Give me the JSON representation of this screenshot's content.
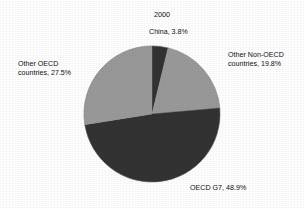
{
  "chart_data": {
    "type": "pie",
    "title": "2000",
    "xlabel": "",
    "ylabel": "",
    "legend_position": "none",
    "grid": false,
    "categories": [
      "China",
      "Other Non-OECD countries",
      "OECD G7",
      "Other OECD countries"
    ],
    "values": [
      3.8,
      19.8,
      48.9,
      27.5
    ],
    "units": "percent",
    "start_angle_deg": 0,
    "direction": "clockwise",
    "slices": [
      {
        "name": "China",
        "value": 3.8,
        "label": "China, 3.8%",
        "color": "#333333",
        "start_deg": 0,
        "end_deg": 13.68
      },
      {
        "name": "Other Non-OECD countries",
        "value": 19.8,
        "label": "Other Non-OECD\ncountries, 19.8%",
        "color": "#9a9a9a",
        "start_deg": 13.68,
        "end_deg": 84.96
      },
      {
        "name": "OECD G7",
        "value": 48.9,
        "label": "OECD G7, 48.9%",
        "color": "#333333",
        "start_deg": 84.96,
        "end_deg": 261.0
      },
      {
        "name": "Other OECD countries",
        "value": 27.5,
        "label": "Other OECD\ncountries, 27.5%",
        "color": "#9a9a9a",
        "start_deg": 261.0,
        "end_deg": 360.0
      }
    ]
  },
  "chart": {
    "title": "2000",
    "background": "#ffffff",
    "outline_color": "#6e6e6e",
    "colors": {
      "dark_slice": "#333333",
      "light_slice": "#9a9a9a",
      "text": "#111111"
    },
    "geometry": {
      "center_x": 152,
      "center_y": 114,
      "radius": 68
    }
  },
  "labels": {
    "china": "China, 3.8%",
    "other_non_oecd_line1": "Other Non-OECD",
    "other_non_oecd_line2": "countries, 19.8%",
    "other_oecd_line1": "Other OECD",
    "other_oecd_line2": "countries, 27.5%",
    "oecd_g7": "OECD G7, 48.9%"
  }
}
